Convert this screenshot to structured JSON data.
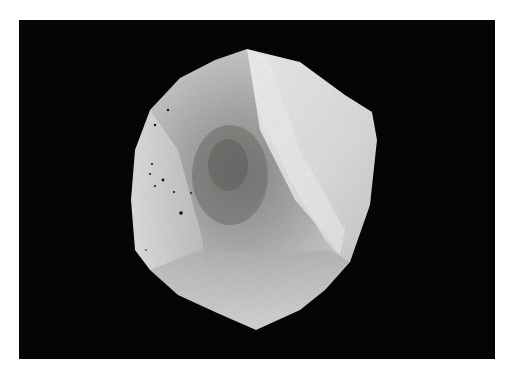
{
  "image": {
    "subject": "rough white crystal stone on black background",
    "colors": {
      "page_margin": "#ffffff",
      "background": "#050505",
      "stone_light": "#e6e6e4",
      "stone_mid": "#b8b8b6",
      "stone_dark": "#7c7c7a",
      "facet_highlight": "#f2f2f0"
    }
  }
}
